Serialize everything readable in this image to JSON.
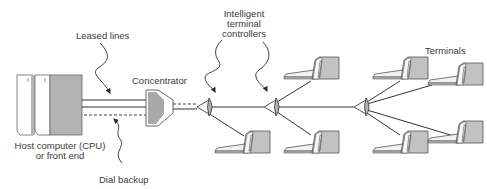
{
  "diagram": {
    "type": "network-topology",
    "labels": {
      "leased_lines": "Leased lines",
      "concentrator": "Concentrator",
      "controllers_1": "Intelligent",
      "controllers_2": "terminal",
      "controllers_3": "controllers",
      "terminals": "Terminals",
      "host_1": "Host computer (CPU)",
      "host_2": "or front end",
      "dial_backup": "Dial backup"
    },
    "nodes": [
      {
        "id": "host",
        "kind": "host-computer",
        "label": "Host computer (CPU) or front end"
      },
      {
        "id": "concentrator",
        "kind": "concentrator",
        "label": "Concentrator"
      },
      {
        "id": "ctrl1",
        "kind": "terminal-controller"
      },
      {
        "id": "ctrl2",
        "kind": "terminal-controller"
      },
      {
        "id": "ctrl3",
        "kind": "terminal-controller"
      },
      {
        "id": "t1",
        "kind": "terminal"
      },
      {
        "id": "t2",
        "kind": "terminal"
      },
      {
        "id": "t3",
        "kind": "terminal"
      },
      {
        "id": "t4",
        "kind": "terminal"
      },
      {
        "id": "t5",
        "kind": "terminal"
      },
      {
        "id": "t6",
        "kind": "terminal"
      },
      {
        "id": "t7",
        "kind": "terminal"
      },
      {
        "id": "t8",
        "kind": "terminal"
      }
    ],
    "edges": [
      {
        "from": "host",
        "to": "concentrator",
        "style": "solid",
        "label": "Leased lines"
      },
      {
        "from": "host",
        "to": "concentrator",
        "style": "dashed",
        "label": "Dial backup"
      },
      {
        "from": "concentrator",
        "to": "ctrl1",
        "style": "dashed"
      },
      {
        "from": "concentrator",
        "to": "ctrl1",
        "style": "solid"
      },
      {
        "from": "ctrl1",
        "to": "ctrl2",
        "style": "solid"
      },
      {
        "from": "ctrl1",
        "to": "t1",
        "style": "solid"
      },
      {
        "from": "ctrl2",
        "to": "t2",
        "style": "solid"
      },
      {
        "from": "ctrl2",
        "to": "t3",
        "style": "solid"
      },
      {
        "from": "ctrl2",
        "to": "ctrl3",
        "style": "solid"
      },
      {
        "from": "ctrl3",
        "to": "t4",
        "style": "solid"
      },
      {
        "from": "ctrl3",
        "to": "t5",
        "style": "solid"
      },
      {
        "from": "ctrl3",
        "to": "t6",
        "style": "solid"
      },
      {
        "from": "ctrl3",
        "to": "t7",
        "style": "solid"
      }
    ],
    "colors": {
      "line": "#3a3a3a",
      "fill_gray": "#b8b8b8",
      "fill_light": "#f4f4f4"
    }
  }
}
